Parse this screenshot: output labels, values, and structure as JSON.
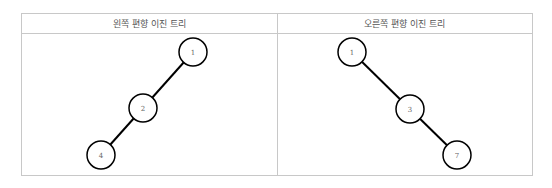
{
  "panels": [
    {
      "title": "왼쪽 편향 이진 트리",
      "nodes": [
        {
          "label": "1",
          "cx": 193,
          "cy": 52
        },
        {
          "label": "2",
          "cx": 143,
          "cy": 108
        },
        {
          "label": "4",
          "cx": 101,
          "cy": 155
        }
      ],
      "edges": [
        [
          0,
          1
        ],
        [
          1,
          2
        ]
      ]
    },
    {
      "title": "오른쪽 편향 이진 트리",
      "nodes": [
        {
          "label": "1",
          "cx": 352,
          "cy": 52
        },
        {
          "label": "3",
          "cx": 410,
          "cy": 109
        },
        {
          "label": "7",
          "cx": 457,
          "cy": 155
        }
      ],
      "edges": [
        [
          0,
          1
        ],
        [
          1,
          2
        ]
      ]
    }
  ],
  "style": {
    "node_radius": 14,
    "edge_color": "#000000",
    "border_color": "#c8c8c8"
  }
}
